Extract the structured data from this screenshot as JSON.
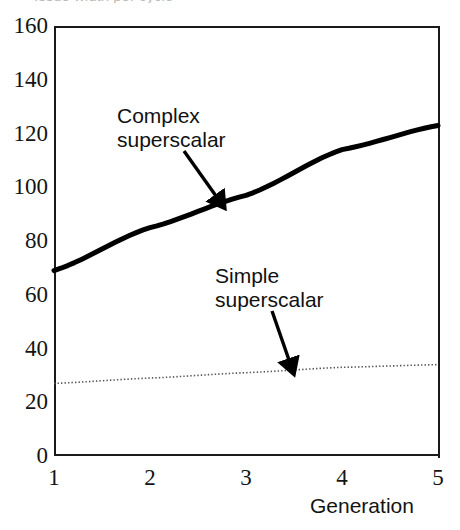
{
  "figure": {
    "title_remnant": "Issue width per cycle",
    "background_color": "#ffffff",
    "axis_color": "#1a1a1a"
  },
  "axes": {
    "y_ticks": [
      "160",
      "140",
      "120",
      "100",
      "80",
      "60",
      "40",
      "20",
      "0"
    ],
    "x_ticks": [
      "1",
      "2",
      "3",
      "4",
      "5"
    ],
    "x_axis_title": "Generation"
  },
  "annotations": [
    {
      "name": "complex-superscalar",
      "text": "Complex\nsuperscalar"
    },
    {
      "name": "simple-superscalar",
      "text": "Simple\nsuperscalar"
    }
  ],
  "chart_data": {
    "type": "line",
    "title": "",
    "xlabel": "Generation",
    "ylabel": "",
    "xlim": [
      1,
      5
    ],
    "ylim": [
      0,
      160
    ],
    "y_ticks": [
      0,
      20,
      40,
      60,
      80,
      100,
      120,
      140,
      160
    ],
    "x_ticks": [
      1,
      2,
      3,
      4,
      5
    ],
    "grid": false,
    "legend": "annotations-inline",
    "x": [
      1,
      2,
      3,
      4,
      5
    ],
    "series": [
      {
        "name": "Complex superscalar",
        "values": [
          69,
          85,
          97,
          114,
          123
        ],
        "style": "solid-thick",
        "color": "#000000",
        "width": 5
      },
      {
        "name": "Simple superscalar",
        "values": [
          27,
          29,
          31,
          33,
          34
        ],
        "style": "dotted",
        "color": "#555555",
        "width": 1.6
      }
    ]
  }
}
